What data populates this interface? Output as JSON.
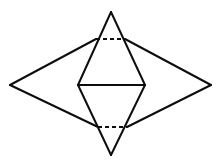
{
  "figure": {
    "canvas": {
      "width": 221,
      "height": 163
    },
    "colors": {
      "background": "#ffffff",
      "stroke": "#0d0d0d"
    },
    "stroke_width": 2,
    "dash_pattern": "4 3",
    "points": {
      "outer_left": {
        "x": 10,
        "y": 85
      },
      "outer_right": {
        "x": 211,
        "y": 85
      },
      "top_apex": {
        "x": 111,
        "y": 12
      },
      "bottom_apex": {
        "x": 111,
        "y": 155
      },
      "top_base_left": {
        "x": 96,
        "y": 39
      },
      "top_base_right": {
        "x": 125,
        "y": 39
      },
      "bottom_base_left": {
        "x": 98,
        "y": 127
      },
      "bottom_base_right": {
        "x": 127,
        "y": 127
      },
      "mid_left": {
        "x": 78,
        "y": 85
      },
      "mid_right": {
        "x": 145,
        "y": 85
      }
    },
    "edges": [
      {
        "name": "outer-upper-left-edge",
        "style": "solid",
        "d": "M 10 85 L 96 39"
      },
      {
        "name": "outer-upper-right-edge",
        "style": "solid",
        "d": "M 125 39 L 211 85"
      },
      {
        "name": "outer-lower-left-edge",
        "style": "solid",
        "d": "M 10 85 L 98 127"
      },
      {
        "name": "outer-lower-right-edge",
        "style": "solid",
        "d": "M 127 127 L 211 85"
      },
      {
        "name": "top-triangle-left-edge",
        "style": "solid",
        "d": "M 111 12 L 78 85"
      },
      {
        "name": "top-triangle-right-edge",
        "style": "solid",
        "d": "M 111 12 L 145 85"
      },
      {
        "name": "bottom-triangle-left-edge",
        "style": "solid",
        "d": "M 111 155 L 78 85"
      },
      {
        "name": "bottom-triangle-right-edge",
        "style": "solid",
        "d": "M 111 155 L 145 85"
      },
      {
        "name": "middle-horizontal-diagonal",
        "style": "solid",
        "d": "M 78 85 L 145 85"
      },
      {
        "name": "top-hidden-base-line",
        "style": "dashed",
        "d": "M 96 39 L 125 39"
      },
      {
        "name": "bottom-hidden-base-line",
        "style": "dashed",
        "d": "M 98 127 L 127 127"
      }
    ]
  }
}
